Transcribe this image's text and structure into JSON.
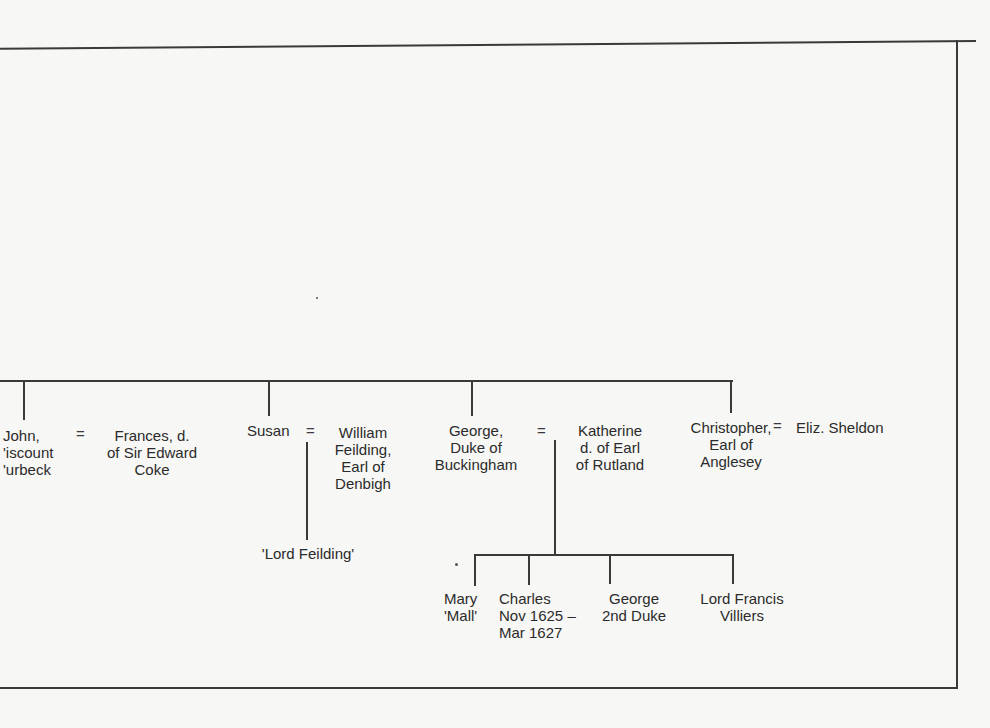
{
  "diagram": {
    "type": "family-tree",
    "frame": {
      "color": "#3a3a3a",
      "background": "#f7f7f5"
    },
    "generation_1": [
      {
        "id": "john",
        "name": "John,\n'iscount\n'urbeck",
        "spouse": "Frances, d.\nof Sir Edward\nCoke",
        "marriage_symbol": "="
      },
      {
        "id": "susan",
        "name": "Susan",
        "spouse": "William\nFeilding,\nEarl of\nDenbigh",
        "marriage_symbol": "=",
        "children": [
          "'Lord Feilding'"
        ]
      },
      {
        "id": "george",
        "name": "George,\nDuke of\nBuckingham",
        "spouse": "Katherine\nd. of Earl\nof Rutland",
        "marriage_symbol": "=",
        "children": [
          "Mary\n'Mall'",
          "Charles\nNov 1625 –\nMar 1627",
          "George\n2nd Duke",
          "Lord Francis\nVilliers"
        ]
      },
      {
        "id": "christopher",
        "name": "Christopher,\nEarl of\nAnglesey",
        "spouse": "Eliz. Sheldon",
        "marriage_symbol": "="
      }
    ],
    "generation_2": {
      "susan_child": "'Lord Feilding'",
      "george_children": [
        {
          "name": "Mary\n'Mall'"
        },
        {
          "name": "Charles\nNov 1625 –\nMar 1627"
        },
        {
          "name": "George\n2nd Duke"
        },
        {
          "name": "Lord Francis\nVilliers"
        }
      ]
    }
  }
}
